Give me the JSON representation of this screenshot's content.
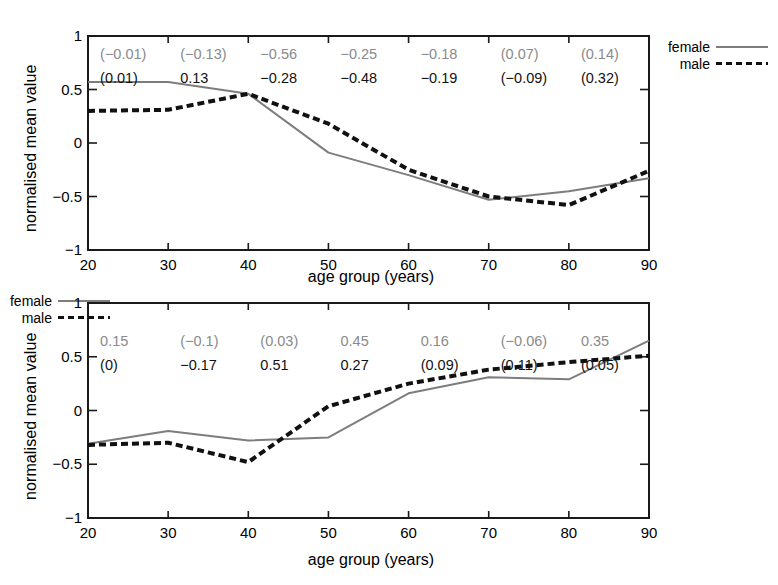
{
  "figure": {
    "legend": {
      "female_label": "female",
      "male_label": "male",
      "female_color": "#7d7d7d",
      "male_color": "#111111",
      "female_style": "solid",
      "male_style": "dashed"
    },
    "axis": {
      "xlabel": "age group (years)",
      "ylabel": "normalised mean value",
      "xticks": [
        "20",
        "30",
        "40",
        "50",
        "60",
        "70",
        "80",
        "90"
      ],
      "yticks": [
        "1",
        "0.5",
        "0",
        "-0.5",
        "-1"
      ]
    }
  },
  "chart_data": [
    {
      "type": "line",
      "panel": "top",
      "title": "",
      "xlabel": "age group (years)",
      "ylabel": "normalised mean value",
      "xlim": [
        20,
        90
      ],
      "ylim": [
        -1,
        1
      ],
      "grid": false,
      "legend_position": "right-outside",
      "x": [
        20,
        30,
        40,
        50,
        60,
        70,
        80,
        90
      ],
      "xticklabels": [
        "20",
        "30",
        "40",
        "50",
        "60",
        "70",
        "80",
        "90"
      ],
      "yticklabels": [
        "1",
        "0.5",
        "0",
        "-0.5",
        "-1"
      ],
      "series": [
        {
          "name": "female",
          "style": "solid",
          "color": "#7d7d7d",
          "values": [
            0.57,
            0.57,
            0.46,
            -0.09,
            -0.3,
            -0.53,
            -0.45,
            -0.33
          ]
        },
        {
          "name": "male",
          "style": "dashed",
          "color": "#111111",
          "values": [
            0.3,
            0.31,
            0.46,
            0.18,
            -0.25,
            -0.5,
            -0.58,
            -0.26
          ]
        }
      ],
      "annotations": {
        "x": [
          20,
          30,
          40,
          50,
          60,
          70,
          80,
          90
        ],
        "female_row": [
          "(-0.01)",
          "(-0.13)",
          "-0.56",
          "-0.25",
          "-0.18",
          "(0.07)",
          "(0.14)"
        ],
        "male_row": [
          "(0.01)",
          "0.13",
          "-0.28",
          "-0.48",
          "-0.19",
          "(-0.09)",
          "(0.32)"
        ]
      }
    },
    {
      "type": "line",
      "panel": "bottom",
      "title": "",
      "xlabel": "age group (years)",
      "ylabel": "normalised mean value",
      "xlim": [
        20,
        90
      ],
      "ylim": [
        -1,
        1
      ],
      "grid": false,
      "legend_position": "right-outside",
      "x": [
        20,
        30,
        40,
        50,
        60,
        70,
        80,
        90
      ],
      "xticklabels": [
        "20",
        "30",
        "40",
        "50",
        "60",
        "70",
        "80",
        "90"
      ],
      "yticklabels": [
        "1",
        "0.5",
        "0",
        "-0.5",
        "-1"
      ],
      "series": [
        {
          "name": "female",
          "style": "solid",
          "color": "#7d7d7d",
          "values": [
            -0.31,
            -0.19,
            -0.28,
            -0.25,
            0.16,
            0.31,
            0.29,
            0.65
          ]
        },
        {
          "name": "male",
          "style": "dashed",
          "color": "#111111",
          "values": [
            -0.32,
            -0.3,
            -0.48,
            0.04,
            0.25,
            0.38,
            0.45,
            0.51
          ]
        }
      ],
      "annotations": {
        "x": [
          20,
          30,
          40,
          50,
          60,
          70,
          80,
          90
        ],
        "female_row": [
          "0.15",
          "(-0.1)",
          "(0.03)",
          "0.45",
          "0.16",
          "(-0.06)",
          "0.35"
        ],
        "male_row": [
          "(0)",
          "-0.17",
          "0.51",
          "0.27",
          "(0.09)",
          "(0.11)",
          "(0.05)"
        ]
      }
    }
  ]
}
